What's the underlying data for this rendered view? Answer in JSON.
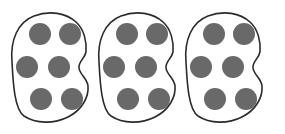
{
  "image": {
    "title": "Three groups of six counters",
    "width": 285,
    "height": 134,
    "background_color": "#ffffff"
  },
  "style": {
    "dot_color": "#696969",
    "outline_color": "#2b2b2b",
    "outline_fill": "#ffffff",
    "outline_width": 1.6,
    "dot_radius": 11
  },
  "chart_data": {
    "type": "diagram",
    "title": "",
    "group_count": 3,
    "dots_per_group": 6,
    "total_dots": 18,
    "groups": [
      {
        "name": "group-1",
        "dot_count": 6,
        "outline_path": "M 12,62 C 10,40 18,22 34,16 C 50,10 66,13 76,22 C 84,29 87,42 86,52 C 85,58 78,62 79,68 C 80,75 87,78 88,86 C 89,97 82,110 68,117 C 54,124 36,124 24,116 C 14,109 13,80 12,62 Z",
        "dots": [
          {
            "cx": 40,
            "cy": 34,
            "r": 11
          },
          {
            "cx": 70,
            "cy": 34,
            "r": 11
          },
          {
            "cx": 27,
            "cy": 67,
            "r": 11
          },
          {
            "cx": 59,
            "cy": 67,
            "r": 11
          },
          {
            "cx": 41,
            "cy": 99,
            "r": 11
          },
          {
            "cx": 72,
            "cy": 99,
            "r": 11
          }
        ]
      },
      {
        "name": "group-2",
        "dot_count": 6,
        "outline_path": "M 99,62 C 97,40 105,22 121,16 C 137,10 153,13 163,22 C 171,29 174,42 173,52 C 172,58 165,62 166,68 C 167,75 174,78 175,86 C 176,97 169,110 155,117 C 141,124 123,124 111,116 C 101,109 100,80 99,62 Z",
        "dots": [
          {
            "cx": 127,
            "cy": 34,
            "r": 11
          },
          {
            "cx": 157,
            "cy": 34,
            "r": 11
          },
          {
            "cx": 114,
            "cy": 67,
            "r": 11
          },
          {
            "cx": 146,
            "cy": 67,
            "r": 11
          },
          {
            "cx": 128,
            "cy": 99,
            "r": 11
          },
          {
            "cx": 159,
            "cy": 99,
            "r": 11
          }
        ]
      },
      {
        "name": "group-3",
        "dot_count": 6,
        "outline_path": "M 186,62 C 184,40 192,22 208,16 C 224,10 240,13 250,22 C 258,29 261,42 260,52 C 259,58 252,62 253,68 C 254,75 261,78 262,86 C 263,97 256,110 242,117 C 228,124 210,124 198,116 C 188,109 187,80 186,62 Z",
        "dots": [
          {
            "cx": 214,
            "cy": 34,
            "r": 11
          },
          {
            "cx": 244,
            "cy": 34,
            "r": 11
          },
          {
            "cx": 201,
            "cy": 67,
            "r": 11
          },
          {
            "cx": 233,
            "cy": 67,
            "r": 11
          },
          {
            "cx": 215,
            "cy": 99,
            "r": 11
          },
          {
            "cx": 246,
            "cy": 99,
            "r": 11
          }
        ]
      }
    ]
  }
}
